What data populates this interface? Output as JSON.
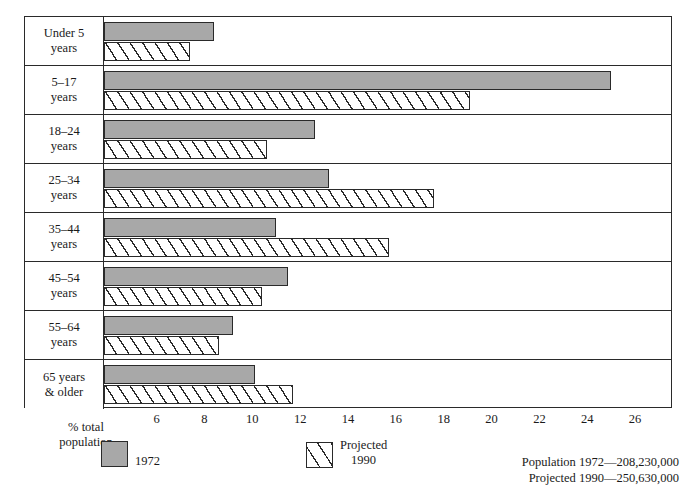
{
  "chart_data": {
    "type": "bar",
    "orientation": "horizontal",
    "title": "",
    "xlabel": "% total population",
    "ylabel": "",
    "xlim": [
      3.8,
      27.5
    ],
    "xticks": [
      6,
      8,
      10,
      12,
      14,
      16,
      18,
      20,
      22,
      24,
      26
    ],
    "grid": false,
    "legend_position": "below-axis",
    "categories": [
      "Under 5 years",
      "5–17 years",
      "18–24 years",
      "25–34 years",
      "35–44 years",
      "45–54 years",
      "55–64 years",
      "65 years & older"
    ],
    "series": [
      {
        "name": "1972",
        "values": [
          8.4,
          25.0,
          12.6,
          13.2,
          11.0,
          11.5,
          9.2,
          10.1
        ]
      },
      {
        "name": "Projected 1990",
        "values": [
          7.4,
          19.1,
          10.6,
          17.6,
          15.7,
          10.4,
          8.6,
          11.7
        ]
      }
    ],
    "annotations": [
      "Population 1972—208,230,000",
      "Projected 1990—250,630,000"
    ]
  },
  "rows": [
    {
      "line1": "Under 5",
      "line2": "years",
      "v1972": 8.4,
      "v1990": 7.4
    },
    {
      "line1": "5–17",
      "line2": "years",
      "v1972": 25.0,
      "v1990": 19.1
    },
    {
      "line1": "18–24",
      "line2": "years",
      "v1972": 12.6,
      "v1990": 10.6
    },
    {
      "line1": "25–34",
      "line2": "years",
      "v1972": 13.2,
      "v1990": 17.6
    },
    {
      "line1": "35–44",
      "line2": "years",
      "v1972": 11.0,
      "v1990": 15.7
    },
    {
      "line1": "45–54",
      "line2": "years",
      "v1972": 11.5,
      "v1990": 10.4
    },
    {
      "line1": "55–64",
      "line2": "years",
      "v1972": 9.2,
      "v1990": 8.6
    },
    {
      "line1": "65 years",
      "line2": "& older",
      "v1972": 10.1,
      "v1990": 11.7
    }
  ],
  "axis": {
    "caption_line1": "% total",
    "caption_line2": "population",
    "ticks": [
      "6",
      "8",
      "10",
      "12",
      "14",
      "16",
      "18",
      "20",
      "22",
      "24",
      "26"
    ]
  },
  "legend": {
    "item_1972": "1972",
    "item_1990_line1": "Projected",
    "item_1990_line2": "1990"
  },
  "footer": {
    "population_1972": "Population 1972—208,230,000",
    "projected_1990": "Projected 1990—250,630,000"
  },
  "colors": {
    "bar_1972_fill": "#a8a8a8",
    "bar_1990_fill": "#ffffff",
    "ink": "#2a2a2a",
    "background": "#ffffff"
  }
}
